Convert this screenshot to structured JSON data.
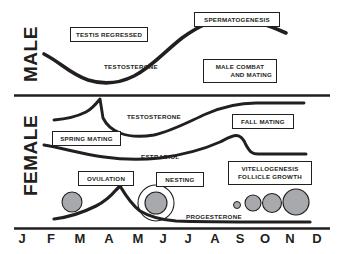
{
  "figure": {
    "background": "#ffffff",
    "ink_color": "#231f20",
    "circle_fill": "#a7a9ac"
  },
  "sections": {
    "male_label": "MALE",
    "female_label": "FEMALE"
  },
  "male": {
    "boxes": [
      {
        "name": "testis-regressed",
        "text": "TESTIS REGRESSED",
        "x": 70,
        "y": 27,
        "w": 78,
        "h": 15
      },
      {
        "name": "spermatogenesis",
        "text": "SPERMATOGENESIS",
        "x": 194,
        "y": 12,
        "w": 86,
        "h": 15
      },
      {
        "name": "male-combat-and-mating",
        "line1": "MALE COMBAT",
        "line2": "AND MATING",
        "x": 203,
        "y": 59,
        "w": 74,
        "h": 23
      }
    ],
    "curve_label": {
      "name": "testosterone",
      "text": "TESTOSTERONE",
      "x": 104,
      "y": 63
    }
  },
  "female": {
    "boxes": [
      {
        "name": "spring-mating",
        "text": "SPRING MATING",
        "x": 52,
        "y": 131,
        "w": 69,
        "h": 15
      },
      {
        "name": "fall-mating",
        "text": "FALL MATING",
        "x": 232,
        "y": 114,
        "w": 62,
        "h": 15
      },
      {
        "name": "ovulation",
        "text": "OVULATION",
        "x": 78,
        "y": 171,
        "w": 56,
        "h": 15
      },
      {
        "name": "nesting",
        "text": "NESTING",
        "x": 156,
        "y": 172,
        "w": 48,
        "h": 15
      },
      {
        "name": "vitellogenesis-follicle-growth",
        "line1": "VITELLOGENESIS",
        "line2": "FOLLICLE GROWTH",
        "x": 228,
        "y": 161,
        "w": 84,
        "h": 24
      }
    ],
    "curve_labels": [
      {
        "name": "testosterone",
        "text": "TESTOSTERONE",
        "x": 127,
        "y": 113
      },
      {
        "name": "estradiol",
        "text": "ESTRADIOL",
        "x": 141,
        "y": 153
      },
      {
        "name": "progesterone",
        "text": "PROGESTERONE",
        "x": 186,
        "y": 213
      }
    ],
    "follicles": [
      {
        "name": "follicle-regressed-feb",
        "cx": 72,
        "cy": 202,
        "r": 10,
        "ring": 0
      },
      {
        "name": "follicle-ovulated-egg-jun",
        "cx": 156,
        "cy": 203,
        "r": 11,
        "ring": 18
      },
      {
        "name": "follicle-growth-1",
        "cx": 237,
        "cy": 205,
        "r": 3.5,
        "ring": 0
      },
      {
        "name": "follicle-growth-2",
        "cx": 253,
        "cy": 203,
        "r": 8,
        "ring": 0
      },
      {
        "name": "follicle-growth-3",
        "cx": 272,
        "cy": 203,
        "r": 9.5,
        "ring": 0
      },
      {
        "name": "follicle-growth-4",
        "cx": 296,
        "cy": 202,
        "r": 13,
        "ring": 0
      }
    ]
  },
  "axis": {
    "months": [
      "J",
      "F",
      "M",
      "A",
      "M",
      "J",
      "J",
      "A",
      "S",
      "O",
      "N",
      "D"
    ],
    "month_x": [
      22,
      51,
      80,
      109,
      138,
      163,
      188,
      215,
      240,
      265,
      290,
      317
    ]
  },
  "chart_data": {
    "type": "line",
    "xlabel": "Month",
    "ylabel": "Relative hormone level",
    "x": [
      "J",
      "F",
      "M",
      "A",
      "M",
      "J",
      "J",
      "A",
      "S",
      "O",
      "N",
      "D"
    ],
    "grid": false,
    "legend": "inline-curve-labels",
    "panels": [
      {
        "panel": "MALE",
        "series": [
          {
            "name": "TESTOSTERONE",
            "values": [
              38,
              25,
              16,
              14,
              18,
              30,
              52,
              74,
              88,
              94,
              92,
              86
            ],
            "annotations": [
              "TESTIS REGRESSED",
              "SPERMATOGENESIS",
              "MALE COMBAT AND MATING"
            ]
          }
        ]
      },
      {
        "panel": "FEMALE",
        "series": [
          {
            "name": "TESTOSTERONE",
            "values": [
              30,
              33,
              78,
              40,
              22,
              18,
              22,
              34,
              50,
              66,
              74,
              76
            ],
            "annotations": [
              "SPRING MATING",
              "FALL MATING"
            ]
          },
          {
            "name": "ESTRADIOL",
            "values": [
              44,
              36,
              28,
              24,
              22,
              24,
              30,
              42,
              62,
              84,
              80,
              80
            ],
            "annotations": [
              "VITELLOGENESIS FOLLICLE GROWTH"
            ]
          },
          {
            "name": "PROGESTERONE",
            "values": [
              8,
              12,
              22,
              86,
              34,
              16,
              10,
              8,
              7,
              7,
              7,
              7
            ],
            "annotations": [
              "OVULATION",
              "NESTING"
            ]
          }
        ]
      }
    ]
  }
}
